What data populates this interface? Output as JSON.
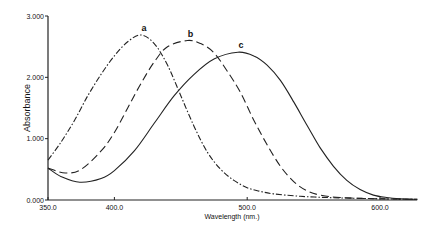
{
  "chart_data": {
    "type": "line",
    "title": "",
    "xlabel": "Wavelength (nm.)",
    "ylabel": "Absorbance",
    "xlim": [
      350,
      628
    ],
    "ylim": [
      0,
      3
    ],
    "x_ticks": [
      "350.0",
      "400.0",
      "500.0",
      "600.0"
    ],
    "y_ticks": [
      "0.000",
      "1.000",
      "2.000",
      "3.000"
    ],
    "grid": false,
    "legend": "curve labels at peaks",
    "series": [
      {
        "name": "a",
        "style": "dash-dot",
        "peak": {
          "x": 420,
          "y": 2.69
        },
        "points": [
          [
            350,
            0.65
          ],
          [
            360,
            0.95
          ],
          [
            370,
            1.3
          ],
          [
            380,
            1.7
          ],
          [
            390,
            2.05
          ],
          [
            400,
            2.35
          ],
          [
            410,
            2.58
          ],
          [
            420,
            2.69
          ],
          [
            430,
            2.55
          ],
          [
            440,
            2.2
          ],
          [
            450,
            1.7
          ],
          [
            460,
            1.2
          ],
          [
            470,
            0.78
          ],
          [
            480,
            0.5
          ],
          [
            490,
            0.32
          ],
          [
            500,
            0.2
          ],
          [
            510,
            0.14
          ],
          [
            520,
            0.1
          ],
          [
            540,
            0.06
          ],
          [
            560,
            0.04
          ],
          [
            580,
            0.03
          ],
          [
            600,
            0.02
          ],
          [
            628,
            0.01
          ]
        ]
      },
      {
        "name": "b",
        "style": "dashed",
        "peak": {
          "x": 455,
          "y": 2.6
        },
        "points": [
          [
            350,
            0.52
          ],
          [
            363,
            0.44
          ],
          [
            375,
            0.5
          ],
          [
            390,
            0.8
          ],
          [
            400,
            1.1
          ],
          [
            410,
            1.5
          ],
          [
            420,
            1.9
          ],
          [
            430,
            2.25
          ],
          [
            440,
            2.5
          ],
          [
            455,
            2.6
          ],
          [
            465,
            2.55
          ],
          [
            475,
            2.4
          ],
          [
            485,
            2.1
          ],
          [
            495,
            1.75
          ],
          [
            505,
            1.3
          ],
          [
            515,
            0.9
          ],
          [
            525,
            0.55
          ],
          [
            535,
            0.3
          ],
          [
            545,
            0.15
          ],
          [
            555,
            0.08
          ],
          [
            570,
            0.04
          ],
          [
            600,
            0.02
          ],
          [
            628,
            0.01
          ]
        ]
      },
      {
        "name": "c",
        "style": "solid",
        "peak": {
          "x": 493,
          "y": 2.41
        },
        "points": [
          [
            350,
            0.52
          ],
          [
            360,
            0.38
          ],
          [
            374,
            0.29
          ],
          [
            390,
            0.35
          ],
          [
            400,
            0.48
          ],
          [
            415,
            0.8
          ],
          [
            430,
            1.25
          ],
          [
            445,
            1.7
          ],
          [
            460,
            2.05
          ],
          [
            475,
            2.3
          ],
          [
            493,
            2.41
          ],
          [
            505,
            2.35
          ],
          [
            515,
            2.2
          ],
          [
            525,
            1.95
          ],
          [
            535,
            1.6
          ],
          [
            545,
            1.22
          ],
          [
            555,
            0.85
          ],
          [
            565,
            0.55
          ],
          [
            575,
            0.32
          ],
          [
            585,
            0.17
          ],
          [
            595,
            0.08
          ],
          [
            605,
            0.04
          ],
          [
            615,
            0.02
          ],
          [
            628,
            0.01
          ]
        ]
      }
    ]
  }
}
